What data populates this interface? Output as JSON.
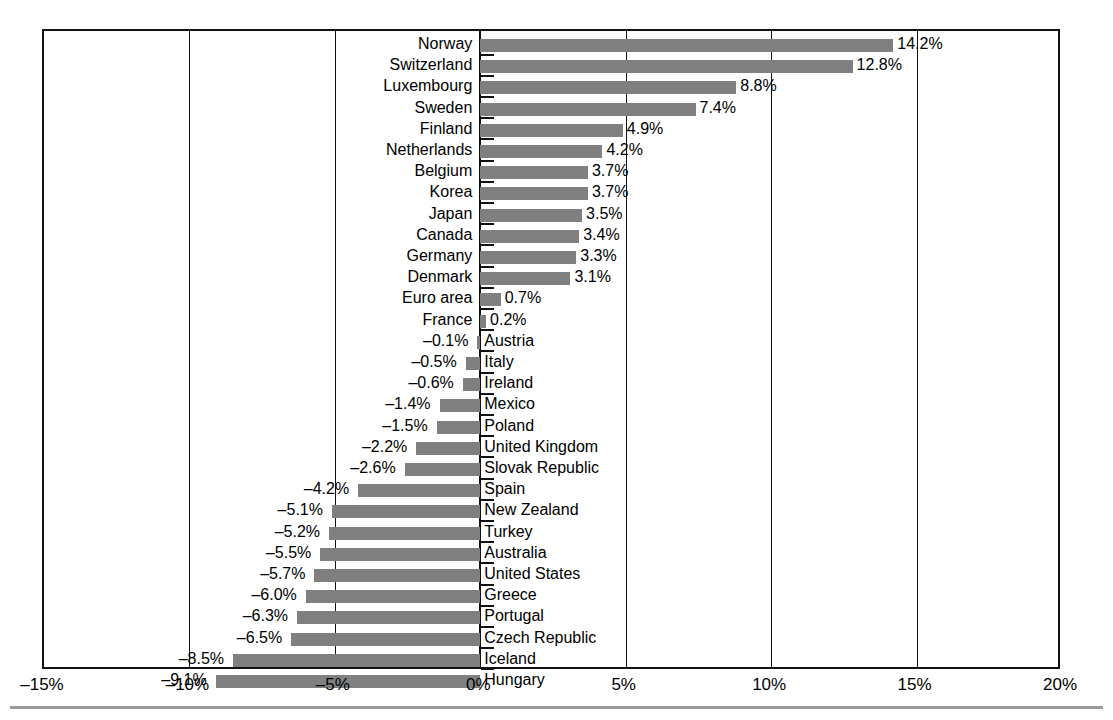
{
  "chart_data": {
    "type": "bar",
    "orientation": "horizontal",
    "title": "",
    "subtitle": "",
    "xlabel": "",
    "ylabel": "",
    "xlim": [
      -15,
      20
    ],
    "xticks": [
      -15,
      -10,
      -5,
      0,
      5,
      10,
      15,
      20
    ],
    "xtick_labels": [
      "–15%",
      "–10%",
      "–5%",
      "0%",
      "5%",
      "10%",
      "15%",
      "20%"
    ],
    "grid": true,
    "grid_axis": "x",
    "legend": false,
    "bar_color": "#808080",
    "axis_color": "#111111",
    "value_label_format": "0.0%",
    "categories": [
      "Norway",
      "Switzerland",
      "Luxembourg",
      "Sweden",
      "Finland",
      "Netherlands",
      "Belgium",
      "Korea",
      "Japan",
      "Canada",
      "Germany",
      "Denmark",
      "Euro area",
      "France",
      "Austria",
      "Italy",
      "Ireland",
      "Mexico",
      "Poland",
      "United Kingdom",
      "Slovak Republic",
      "Spain",
      "New Zealand",
      "Turkey",
      "Australia",
      "United States",
      "Greece",
      "Portugal",
      "Czech Republic",
      "Iceland",
      "Hungary"
    ],
    "values": [
      14.2,
      12.8,
      8.8,
      7.4,
      4.9,
      4.2,
      3.7,
      3.7,
      3.5,
      3.4,
      3.3,
      3.1,
      0.7,
      0.2,
      -0.1,
      -0.5,
      -0.6,
      -1.4,
      -1.5,
      -2.2,
      -2.6,
      -4.2,
      -5.1,
      -5.2,
      -5.5,
      -5.7,
      -6.0,
      -6.3,
      -6.5,
      -8.5,
      -9.1
    ],
    "value_labels": [
      "14.2%",
      "12.8%",
      "8.8%",
      "7.4%",
      "4.9%",
      "4.2%",
      "3.7%",
      "3.7%",
      "3.5%",
      "3.4%",
      "3.3%",
      "3.1%",
      "0.7%",
      "0.2%",
      "–0.1%",
      "–0.5%",
      "–0.6%",
      "–1.4%",
      "–1.5%",
      "–2.2%",
      "–2.6%",
      "–4.2%",
      "–5.1%",
      "–5.2%",
      "–5.5%",
      "–5.7%",
      "–6.0%",
      "–6.3%",
      "–6.5%",
      "–8.5%",
      "–9.1%"
    ]
  }
}
